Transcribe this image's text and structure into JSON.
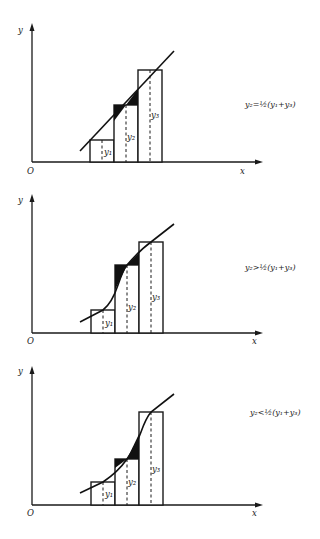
{
  "figure": {
    "panels": [
      {
        "id": "equal",
        "axis_labels": {
          "y": "y",
          "x": "x",
          "origin": "O"
        },
        "ordinate_labels": [
          "y1",
          "y2",
          "y3"
        ],
        "ordinate_text": {
          "y1": "y₁",
          "y2": "y₂",
          "y3": "y₃"
        },
        "equation": "y₂=½(y₁+y₃)",
        "relation": "equal"
      },
      {
        "id": "greater",
        "axis_labels": {
          "y": "y",
          "x": "x",
          "origin": "O"
        },
        "ordinate_labels": [
          "y1",
          "y2",
          "y3"
        ],
        "ordinate_text": {
          "y1": "y₁",
          "y2": "y₂",
          "y3": "y₃"
        },
        "equation": "y₂>½(y₁+y₃)",
        "relation": "greater than"
      },
      {
        "id": "less",
        "axis_labels": {
          "y": "y",
          "x": "x",
          "origin": "O"
        },
        "ordinate_labels": [
          "y1",
          "y2",
          "y3"
        ],
        "ordinate_text": {
          "y1": "y₁",
          "y2": "y₂",
          "y3": "y₃"
        },
        "equation": "y₂<½(y₁+y₃)",
        "relation": "less than"
      }
    ],
    "colors": {
      "ink": "#1a1a1a",
      "background": "#ffffff",
      "shade": "#111111"
    }
  }
}
